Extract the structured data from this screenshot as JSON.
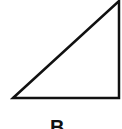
{
  "diagram": {
    "shape": "right-triangle",
    "stroke_color": "#111111",
    "vertices": [
      [
        13,
        98
      ],
      [
        119,
        0
      ],
      [
        119,
        98
      ]
    ],
    "label": "B"
  }
}
